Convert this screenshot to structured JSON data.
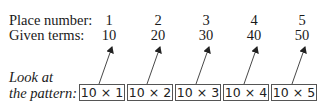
{
  "table": {
    "rows": [
      {
        "label": "Place number:",
        "values": [
          "1",
          "2",
          "3",
          "4",
          "5"
        ]
      },
      {
        "label": "Given terms:",
        "values": [
          "10",
          "20",
          "30",
          "40",
          "50"
        ]
      }
    ]
  },
  "note": {
    "line1": "Look at",
    "line2": "the pattern:"
  },
  "pattern_boxes": [
    "10 × 1",
    "10 × 2",
    "10 × 3",
    "10 × 4",
    "10 × 5"
  ],
  "colors": {
    "text": "#1a1a1a",
    "box_border": "#555555",
    "arrow": "#222222"
  }
}
